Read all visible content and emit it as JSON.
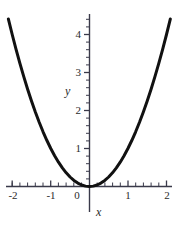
{
  "chart_data": {
    "type": "line",
    "title": "",
    "subtitle": "",
    "xlabel": "x",
    "ylabel": "y",
    "function": "y = x^2",
    "grid": false,
    "legend": false,
    "legend_position": "none",
    "xlim": [
      -2.15,
      2.15
    ],
    "ylim": [
      -0.12,
      4.45
    ],
    "x_major_ticks": [
      -2,
      -1,
      0,
      1,
      2
    ],
    "x_tick_labels": [
      "-2",
      "-1",
      "0",
      "1",
      "2"
    ],
    "x_minor_tick_step": 0.2,
    "y_major_ticks": [
      1,
      2,
      3,
      4
    ],
    "y_tick_labels": [
      "1",
      "2",
      "3",
      "4"
    ],
    "y_minor_tick_step": 0.2,
    "origin_label": "0",
    "series": [
      {
        "name": "y = x^2",
        "color": "#111111",
        "width": 3,
        "x": [
          -2.1,
          -2.0,
          -1.9,
          -1.8,
          -1.7,
          -1.6,
          -1.5,
          -1.4,
          -1.3,
          -1.2,
          -1.1,
          -1.0,
          -0.9,
          -0.8,
          -0.7,
          -0.6,
          -0.5,
          -0.4,
          -0.3,
          -0.2,
          -0.1,
          0.0,
          0.1,
          0.2,
          0.3,
          0.4,
          0.5,
          0.6,
          0.7,
          0.8,
          0.9,
          1.0,
          1.1,
          1.2,
          1.3,
          1.4,
          1.5,
          1.6,
          1.7,
          1.8,
          1.9,
          2.0,
          2.1
        ],
        "y": [
          4.41,
          4.0,
          3.61,
          3.24,
          2.89,
          2.56,
          2.25,
          1.96,
          1.69,
          1.44,
          1.21,
          1.0,
          0.81,
          0.64,
          0.49,
          0.36,
          0.25,
          0.16,
          0.09,
          0.04,
          0.01,
          0.0,
          0.01,
          0.04,
          0.09,
          0.16,
          0.25,
          0.36,
          0.49,
          0.64,
          0.81,
          1.0,
          1.21,
          1.44,
          1.69,
          1.96,
          2.25,
          2.56,
          2.89,
          3.24,
          3.61,
          4.0,
          4.41
        ]
      }
    ],
    "axis_color": "#3a3a4a",
    "background": "#ffffff"
  },
  "labels": {
    "x_axis_name": "x",
    "y_axis_name": "y",
    "x_neg2": "-2",
    "x_neg1": "-1",
    "x_zero": "0",
    "x_pos1": "1",
    "x_pos2": "2",
    "y_1": "1",
    "y_2": "2",
    "y_3": "3",
    "y_4": "4"
  }
}
